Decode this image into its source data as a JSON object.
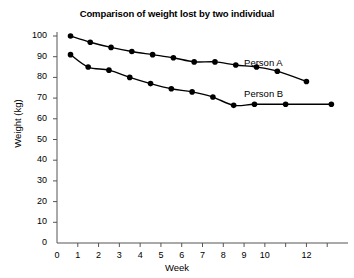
{
  "chart_data": {
    "type": "line",
    "title": "Comparison of weight lost by two individual",
    "xlabel": "Week",
    "ylabel": "Weight (kg)",
    "xlim": [
      0,
      14
    ],
    "ylim": [
      0,
      105
    ],
    "grid": false,
    "legend_position": "inline-right",
    "x_ticks": [
      0,
      1,
      2,
      3,
      4,
      5,
      6,
      7,
      8,
      9,
      10,
      11,
      12,
      13
    ],
    "x_tick_labels": [
      "0",
      "1",
      "2",
      "3",
      "4",
      "5",
      "6",
      "7",
      "8",
      "9",
      "10",
      "",
      "12",
      ""
    ],
    "y_ticks": [
      0,
      10,
      20,
      30,
      40,
      50,
      60,
      70,
      80,
      90,
      100
    ],
    "y_tick_labels": [
      "0",
      "10",
      "20",
      "30",
      "40",
      "50",
      "60",
      "70",
      "80",
      "90",
      "100"
    ],
    "marker": "filled-circle",
    "line_color": "#000000",
    "marker_color": "#000000",
    "series": [
      {
        "name": "Person A",
        "label_x": 9.0,
        "label_y": 87,
        "x": [
          0.65,
          1.6,
          2.6,
          3.6,
          4.6,
          5.6,
          6.6,
          7.6,
          8.6,
          9.6,
          10.6,
          12.0
        ],
        "y": [
          100.0,
          97.0,
          94.5,
          92.5,
          91.0,
          89.5,
          87.5,
          87.5,
          86.0,
          85.0,
          83.0,
          78.0
        ]
      },
      {
        "name": "Person B",
        "label_x": 9.0,
        "label_y": 72,
        "x": [
          0.65,
          1.5,
          2.5,
          3.5,
          4.5,
          5.5,
          6.5,
          7.5,
          8.5,
          9.5,
          11.0,
          13.2
        ],
        "y": [
          91.0,
          85.0,
          83.5,
          80.0,
          77.0,
          74.5,
          73.0,
          70.5,
          66.5,
          67.0,
          67.0,
          67.0
        ]
      }
    ]
  }
}
